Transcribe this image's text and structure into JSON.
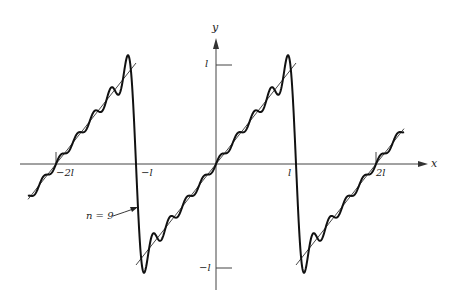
{
  "chart_data": {
    "type": "line",
    "title": "",
    "xlabel": "x",
    "ylabel": "y",
    "x_ticks": [
      "-2l",
      "-l",
      "l",
      "2l"
    ],
    "y_ticks": [
      "l",
      "-l"
    ],
    "x_tick_values_in_l": [
      -2,
      -1,
      1,
      2
    ],
    "y_tick_values_in_l": [
      1,
      -1
    ],
    "xlim_in_l": [
      -2.35,
      2.35
    ],
    "ylim_in_l": [
      -1.15,
      1.15
    ],
    "grid": false,
    "legend": null,
    "series": [
      {
        "name": "f(x) = x (periodic sawtooth, period 2l)",
        "style": "thin line",
        "segments_in_l": [
          [
            [
              -2.35,
              -0.35
            ],
            [
              -1.0,
              1.0
            ]
          ],
          [
            [
              -1.0,
              -1.0
            ],
            [
              1.0,
              1.0
            ]
          ],
          [
            [
              1.0,
              -1.0
            ],
            [
              2.35,
              0.35
            ]
          ]
        ]
      },
      {
        "name": "Fourier partial sum, n = 9",
        "style": "thick line",
        "formula": "S_9(x) = (2l/pi) * sum_{k=1..9} (-1)^(k+1) sin(k*pi*x/l) / k",
        "peak_overshoot_in_l": 1.09
      }
    ],
    "annotations": [
      {
        "text": "n = 9",
        "arrow_to": "steep descending segment near x = -l"
      }
    ]
  },
  "labels": {
    "x_axis": "x",
    "y_axis": "y",
    "tick_neg2l": "−2l",
    "tick_negl": "−l",
    "tick_l": "l",
    "tick_2l": "2l",
    "tick_y_l": "l",
    "tick_y_negl": "−l",
    "annotation_n": "n = 9"
  }
}
